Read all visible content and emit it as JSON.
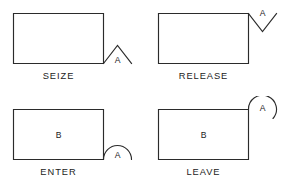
{
  "diagram": {
    "canvas": {
      "width": 290,
      "height": 193,
      "background": "#ffffff"
    },
    "stroke_color": "#2b2b2b",
    "text_color": "#222222",
    "figures": [
      {
        "id": "seize",
        "caption": "SEIZE",
        "marker_label": "A",
        "inner_label": "",
        "marker_shape": "triangle-peak",
        "marker_position": "bottom-right"
      },
      {
        "id": "release",
        "caption": "RELEASE",
        "marker_label": "A",
        "inner_label": "",
        "marker_shape": "triangle-valley",
        "marker_position": "top-right"
      },
      {
        "id": "enter",
        "caption": "ENTER",
        "marker_label": "A",
        "inner_label": "B",
        "marker_shape": "arc-dome",
        "marker_position": "bottom-right"
      },
      {
        "id": "leave",
        "caption": "LEAVE",
        "marker_label": "A",
        "inner_label": "B",
        "marker_shape": "arc-dome",
        "marker_position": "top-right"
      }
    ]
  }
}
